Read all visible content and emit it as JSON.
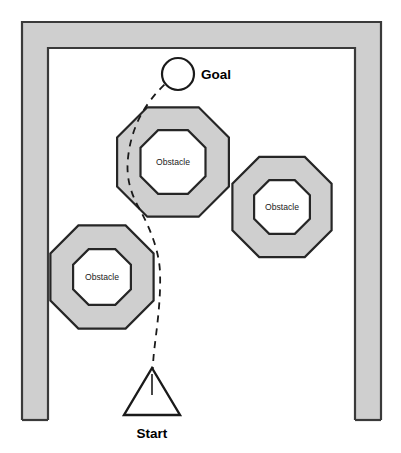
{
  "diagram": {
    "title_present": false,
    "background_color": "#ffffff",
    "wall": {
      "name": "corridor-wall",
      "fill_color": "#cfcfcf",
      "stroke_color": "#3a3a3a",
      "shape": "u-shaped-open-bottom",
      "thickness_px": 27,
      "left_x": 21,
      "right_x": 382,
      "top_y": 21,
      "bottom_y": 420
    },
    "goal": {
      "label": "Goal",
      "marker": "circle",
      "cx": 178,
      "cy": 74,
      "r": 16,
      "label_x": 200,
      "label_y": 79,
      "has_incoming_arrow": true
    },
    "start": {
      "label": "Start",
      "marker": "triangle",
      "apex_x": 152,
      "apex_y": 368,
      "base_y": 415,
      "base_left_x": 128,
      "base_right_x": 180,
      "label_x": 154,
      "label_y": 432
    },
    "obstacles": [
      {
        "label": "Obstacle",
        "cx": 173,
        "cy": 162,
        "outer_r": 62,
        "inner_r": 36,
        "outer_fill": "#cfcfcf",
        "inner_fill": "#ffffff"
      },
      {
        "label": "Obstacle",
        "cx": 282,
        "cy": 207,
        "outer_r": 55,
        "inner_r": 31,
        "outer_fill": "#cfcfcf",
        "inner_fill": "#ffffff"
      },
      {
        "label": "Obstacle",
        "cx": 102,
        "cy": 277,
        "outer_r": 57,
        "inner_r": 32,
        "outer_fill": "#cfcfcf",
        "inner_fill": "#ffffff"
      }
    ],
    "path": {
      "name": "planned-trajectory",
      "style": "dashed",
      "stroke_color": "#1a1a1a",
      "dash_pattern": "7 6",
      "direction": "start-to-goal",
      "waypoints": [
        [
          152,
          412
        ],
        [
          152,
          380
        ],
        [
          155,
          340
        ],
        [
          158,
          300
        ],
        [
          160,
          262
        ],
        [
          156,
          232
        ],
        [
          144,
          212
        ],
        [
          133,
          192
        ],
        [
          128,
          168
        ],
        [
          129,
          145
        ],
        [
          136,
          122
        ],
        [
          150,
          100
        ],
        [
          163,
          86
        ]
      ]
    }
  }
}
